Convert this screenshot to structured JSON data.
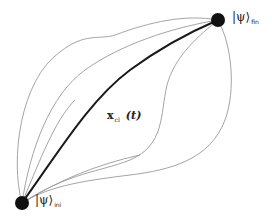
{
  "diagram": {
    "type": "path-integral",
    "start_state": {
      "symbol": "|ψ⟩",
      "subscript": "ini"
    },
    "end_state": {
      "symbol": "|ψ⟩",
      "subscript": "fin"
    },
    "classical_path": {
      "symbol": "x",
      "subscript": "cl",
      "argument": "(t)"
    },
    "colors": {
      "classical_path": "#1a1a1a",
      "alternate_paths": "#9a9a9a",
      "endpoints": "#111111"
    },
    "alternate_path_count": 6
  }
}
